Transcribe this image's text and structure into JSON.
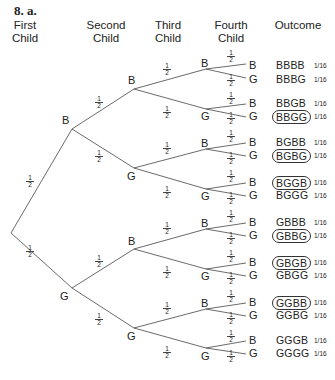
{
  "title": "8. a.",
  "headers": [
    "First Child",
    "Second Child",
    "Third Child",
    "Fourth Child",
    "Outcome"
  ],
  "branch_probability": "1/2",
  "branch_probability_parts": {
    "num": "1",
    "den": "2"
  },
  "outcome_probability": "1/16",
  "tree": {
    "level1": [
      "B",
      "G"
    ],
    "level2": [
      "B",
      "G",
      "B",
      "G"
    ],
    "level3": [
      "B",
      "G",
      "B",
      "G",
      "B",
      "G",
      "B",
      "G"
    ],
    "level4": [
      "B",
      "G",
      "B",
      "G",
      "B",
      "G",
      "B",
      "G",
      "B",
      "G",
      "B",
      "G",
      "B",
      "G",
      "B",
      "G"
    ]
  },
  "outcomes": [
    {
      "label": "BBBB",
      "circled": false,
      "prob": "1/16"
    },
    {
      "label": "BBBG",
      "circled": false,
      "prob": "1/16"
    },
    {
      "label": "BBGB",
      "circled": false,
      "prob": "1/16"
    },
    {
      "label": "BBGG",
      "circled": true,
      "prob": "1/16"
    },
    {
      "label": "BGBB",
      "circled": false,
      "prob": "1/16"
    },
    {
      "label": "BGBG",
      "circled": true,
      "prob": "1/16"
    },
    {
      "label": "BGGB",
      "circled": true,
      "prob": "1/16"
    },
    {
      "label": "BGGG",
      "circled": false,
      "prob": "1/16"
    },
    {
      "label": "GBBB",
      "circled": false,
      "prob": "1/16"
    },
    {
      "label": "GBBG",
      "circled": true,
      "prob": "1/16"
    },
    {
      "label": "GBGB",
      "circled": true,
      "prob": "1/16"
    },
    {
      "label": "GBGG",
      "circled": false,
      "prob": "1/16"
    },
    {
      "label": "GGBB",
      "circled": true,
      "prob": "1/16"
    },
    {
      "label": "GGBG",
      "circled": false,
      "prob": "1/16"
    },
    {
      "label": "GGGB",
      "circled": false,
      "prob": "1/16"
    },
    {
      "label": "GGGG",
      "circled": false,
      "prob": "1/16"
    }
  ]
}
